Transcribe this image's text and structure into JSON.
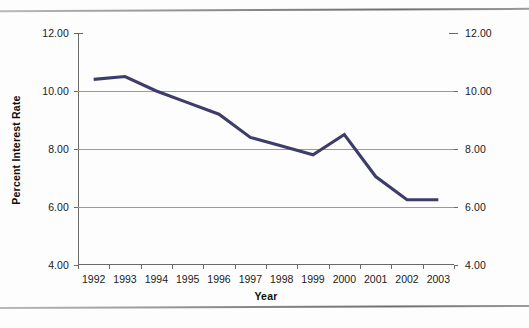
{
  "chart_data": {
    "type": "line",
    "title": "",
    "subtitle": "",
    "xlabel": "Year",
    "ylabel": "Percent Interest Rate",
    "ylabel_right": "Percent Interest Rate",
    "categories": [
      "1992",
      "1993",
      "1994",
      "1995",
      "1996",
      "1997",
      "1998",
      "1999",
      "2000",
      "2001",
      "2002",
      "2003"
    ],
    "series": [
      {
        "name": "Percent Interest Rate",
        "color": "#3d3d6b",
        "values": [
          10.4,
          10.5,
          10.0,
          9.6,
          9.2,
          8.4,
          8.1,
          7.8,
          8.5,
          7.05,
          6.25,
          6.25
        ]
      }
    ],
    "ylim": [
      4.0,
      12.0
    ],
    "ytick_values": [
      12.0,
      10.0,
      8.0,
      6.0,
      4.0
    ],
    "ytick_labels_left": [
      "12.00",
      "10.00",
      "8.00",
      "6.00",
      "4.00"
    ],
    "ytick_labels_right": [
      "12.00",
      "10.00",
      "8.00",
      "6.00",
      "4.00"
    ],
    "grid": true,
    "grid_axis": "y",
    "legend": false,
    "legend_position": "none",
    "dual_axis": true,
    "annotations": []
  },
  "figure": {
    "background_color": "#fdfdfd",
    "plot_background_color": "#ffffff",
    "gridline_color": "#9a9a9a",
    "axis_color": "#6a6a6a",
    "text_color": "#1a1a1a",
    "rule_top_name": "page-rule-top",
    "rule_bottom_name": "page-rule-bottom"
  }
}
